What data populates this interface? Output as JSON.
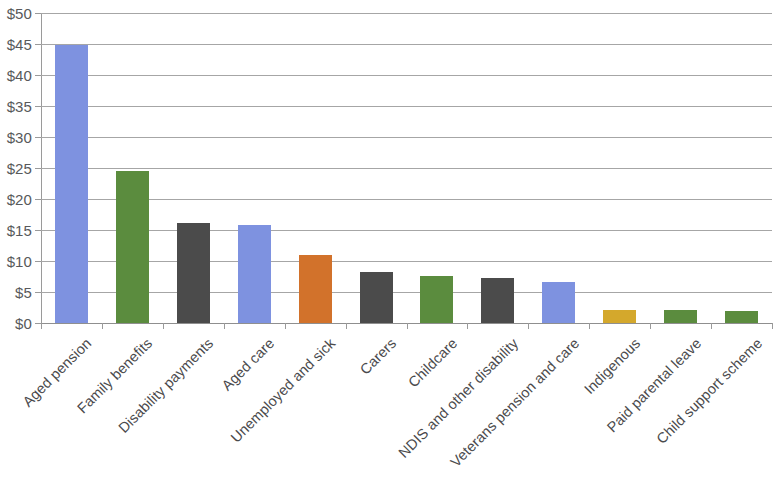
{
  "chart_data": {
    "type": "bar",
    "title": "",
    "subtitle": "",
    "xlabel": "",
    "ylabel": "",
    "ylim": [
      0,
      50
    ],
    "ytick_step": 5,
    "grid": true,
    "legend": "none",
    "currency_prefix": "$",
    "categories": [
      "Aged pension",
      "Family benefits",
      "Disability payments",
      "Aged care",
      "Unemployed and sick",
      "Carers",
      "Childcare",
      "NDIS and other disability",
      "Veterans pension and care",
      "Indigenous",
      "Paid parental leave",
      "Child support scheme"
    ],
    "values": [
      44.8,
      24.5,
      16.2,
      15.8,
      11.0,
      8.2,
      7.6,
      7.2,
      6.6,
      2.1,
      2.1,
      1.9
    ],
    "bar_colors": [
      "#7E92E0",
      "#5B8C3E",
      "#4B4B4B",
      "#7E92E0",
      "#D2722B",
      "#4B4B4B",
      "#5B8C3E",
      "#4B4B4B",
      "#7E92E0",
      "#D4A82C",
      "#5B8C3E",
      "#5B8C3E"
    ],
    "y_tick_labels": [
      "$50",
      "$45",
      "$40",
      "$35",
      "$30",
      "$25",
      "$20",
      "$15",
      "$10",
      "$5",
      "$0"
    ],
    "y_tick_values": [
      50,
      45,
      40,
      35,
      30,
      25,
      20,
      15,
      10,
      5,
      0
    ],
    "axis_color": "#9a9a9a",
    "gridline_color": "#a6a6a6",
    "label_color": "#4a4a4c",
    "background": "#ffffff"
  }
}
